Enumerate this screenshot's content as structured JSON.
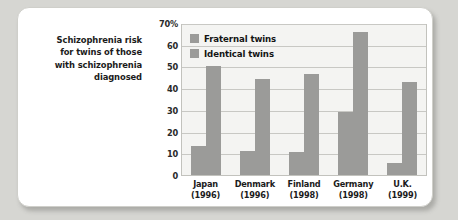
{
  "caption": {
    "lines": [
      "Schizophrenia risk",
      "for twins of those",
      "with schizophrenia",
      "diagnosed"
    ]
  },
  "colors": {
    "bar": "#9b9b99",
    "plot_background": "#f4f4f2",
    "gridline": "#c8c8c4",
    "card_background": "#ffffff",
    "figure_background": "#d6d6d2"
  },
  "chart_data": {
    "type": "bar",
    "title": "Schizophrenia risk for twins of those with schizophrenia diagnosed",
    "xlabel": "",
    "ylabel": "",
    "ylim": [
      0,
      70
    ],
    "yticks": [
      0,
      10,
      20,
      30,
      40,
      50,
      60,
      70
    ],
    "ytick_labels": [
      "0",
      "10",
      "20",
      "30",
      "40",
      "50",
      "60",
      "70%"
    ],
    "grid": true,
    "legend_position": "top-left inside plot",
    "categories": [
      "Japan",
      "Denmark",
      "Finland",
      "Germany",
      "U.K."
    ],
    "category_years": [
      "(1996)",
      "(1996)",
      "(1998)",
      "(1998)",
      "(1999)"
    ],
    "series": [
      {
        "name": "Fraternal twins",
        "color": "#9b9b99",
        "values": [
          13.5,
          11,
          10.5,
          29,
          5.5
        ]
      },
      {
        "name": "Identical twins",
        "color": "#9b9b99",
        "values": [
          50,
          44,
          46.5,
          66,
          43
        ]
      }
    ]
  }
}
